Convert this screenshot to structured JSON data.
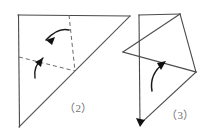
{
  "page": {
    "background_color": "#ffffff",
    "width": 213,
    "height": 136
  },
  "figures": [
    {
      "id": "figure-2",
      "label": "（2）",
      "label_position": {
        "x": 64,
        "y": 99
      },
      "description": "Square outline with diagonal, dashed fold lines and two curved fold arrows",
      "stroke_color": "#4a4a4a",
      "dashed_color": "#6a6a6a",
      "shapes": {
        "square_outline": [
          {
            "x": 18,
            "y": 15
          },
          {
            "x": 130,
            "y": 16
          },
          {
            "x": 19,
            "y": 127
          }
        ],
        "square_top_edge": {
          "x1": 18,
          "y1": 15,
          "x2": 130,
          "y2": 16
        },
        "square_left_edge": {
          "x1": 18,
          "y1": 15,
          "x2": 19,
          "y2": 127
        },
        "diagonal": {
          "x1": 19,
          "y1": 127,
          "x2": 130,
          "y2": 16
        },
        "dashed_vertical": {
          "x1": 69,
          "y1": 15,
          "x2": 75,
          "y2": 71
        },
        "dashed_horizontal": {
          "x1": 19,
          "y1": 57,
          "x2": 75,
          "y2": 71
        }
      },
      "arrows": [
        {
          "name": "fold-arrow-upper",
          "path": "M 68,31 Q 56,28 45,41",
          "head_at": {
            "x": 45,
            "y": 41
          },
          "direction": "left"
        },
        {
          "name": "fold-arrow-lower",
          "path": "M 35,77 Q 34,66 44,58",
          "head_at": {
            "x": 44,
            "y": 58
          },
          "direction": "up-left"
        }
      ]
    },
    {
      "id": "figure-3",
      "label": "（3）",
      "label_position": {
        "x": 166,
        "y": 106
      },
      "description": "Quadrilateral with internal crossing lines and a curved fold arrow",
      "stroke_color": "#4a4a4a",
      "shapes": {
        "vertical_edge": {
          "x1": 139,
          "y1": 15,
          "x2": 140,
          "y2": 126
        },
        "top_edge": {
          "x1": 139,
          "y1": 15,
          "x2": 180,
          "y2": 14
        },
        "right_edge": {
          "x1": 180,
          "y1": 14,
          "x2": 196,
          "y2": 72
        },
        "diagonal_long": {
          "x1": 180,
          "y1": 14,
          "x2": 123,
          "y2": 52
        },
        "diagonal_cross": {
          "x1": 123,
          "y1": 52,
          "x2": 196,
          "y2": 72
        },
        "bottom_edge": {
          "x1": 196,
          "y1": 72,
          "x2": 140,
          "y2": 126
        }
      },
      "arrows": [
        {
          "name": "fold-arrow-main",
          "path": "M 152,90 Q 150,74 165,62",
          "head_at": {
            "x": 165,
            "y": 62
          },
          "direction": "up-right"
        },
        {
          "name": "bottom-arrowhead",
          "head_at": {
            "x": 140,
            "y": 126
          },
          "direction": "down"
        }
      ]
    }
  ]
}
